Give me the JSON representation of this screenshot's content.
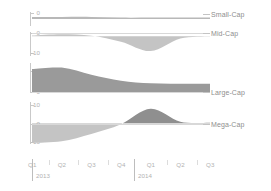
{
  "chart_data": {
    "type": "area",
    "title": "",
    "subtitle": "",
    "xlabel": "",
    "ylabel": "",
    "grid": false,
    "legend_position": "right",
    "layout": "small-multiples-stacked-panels",
    "x": [
      "Q1 2013",
      "Q2 2013",
      "Q3 2013",
      "Q4 2013",
      "Q1 2014",
      "Q2 2014",
      "Q3 2014"
    ],
    "categories": [
      "Q1",
      "Q2",
      "Q3",
      "Q4",
      "Q1",
      "Q2",
      "Q3"
    ],
    "years": [
      "2013",
      "2014"
    ],
    "series": [
      {
        "name": "Small-Cap",
        "values": [
          0.3,
          0.3,
          0.3,
          0.2,
          0.2,
          0.2,
          0.2
        ],
        "ylim": [
          -1,
          1
        ],
        "yticks": [
          0
        ],
        "yticklabels": [
          "0"
        ],
        "fill": "#b8b8b8"
      },
      {
        "name": "Mid-Cap",
        "values": [
          0.4,
          1.2,
          0.3,
          -3.5,
          -9.5,
          -1.5,
          -0.2
        ],
        "ylim": [
          -12,
          2
        ],
        "yticks": [
          0,
          -10
        ],
        "yticklabels": [
          "0",
          "-10"
        ],
        "fill": "#c4c4c4"
      },
      {
        "name": "Large-Cap",
        "values": [
          12.8,
          13.6,
          9.8,
          6.6,
          5.2,
          5.0,
          5.0
        ],
        "ylim": [
          0,
          15
        ],
        "yticks": [
          10,
          0
        ],
        "yticklabels": [
          "10",
          "0"
        ],
        "fill": "#9a9a9a"
      },
      {
        "name": "Mega-Cap",
        "values": [
          -12.0,
          -11.0,
          -6.5,
          -0.5,
          9.0,
          1.0,
          0.4
        ],
        "ylim": [
          -14,
          12
        ],
        "yticks": [
          10,
          0,
          -10
        ],
        "yticklabels": [
          "10",
          "0",
          "-10"
        ],
        "fill_negative": "#c4c4c4",
        "fill_positive": "#8f8f8f"
      }
    ],
    "colors": {
      "axis": "#c9c9c9",
      "tick_text": "#b2b2b2",
      "label_text": "#8e8e8e",
      "zero_line": "#d8d8d8",
      "background": "#ffffff"
    }
  },
  "panels": {
    "small_cap": {
      "label": "Small-Cap",
      "tick_0": "0"
    },
    "mid_cap": {
      "label": "Mid-Cap",
      "tick_0": "0",
      "tick_neg10": "-10"
    },
    "large_cap": {
      "label": "Large-Cap",
      "tick_10": "10",
      "tick_0": "0"
    },
    "mega_cap": {
      "label": "Mega-Cap",
      "tick_10": "10",
      "tick_0": "0",
      "tick_neg10": "-10"
    }
  },
  "x_axis": {
    "quarters": [
      {
        "label": "Q1"
      },
      {
        "label": "Q2"
      },
      {
        "label": "Q3"
      },
      {
        "label": "Q4"
      },
      {
        "label": "Q1"
      },
      {
        "label": "Q2"
      },
      {
        "label": "Q3"
      }
    ],
    "year_2013": "2013",
    "year_2014": "2014"
  }
}
